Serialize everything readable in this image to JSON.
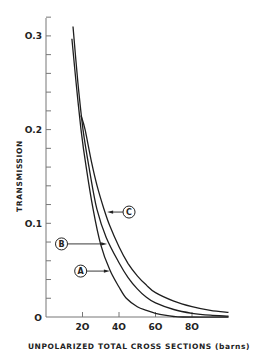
{
  "chart_data": {
    "type": "line",
    "title": "",
    "xlabel": "UNPOLARIZED TOTAL CROSS SECTIONS (barns)",
    "ylabel": "TRANSMISSION",
    "xlim": [
      0,
      100
    ],
    "ylim": [
      0,
      0.32
    ],
    "x_ticks": [
      20,
      40,
      60,
      80
    ],
    "x_tick_labels": [
      "2O",
      "4O",
      "6O",
      "8O"
    ],
    "y_ticks": [
      0,
      0.1,
      0.2,
      0.3
    ],
    "y_tick_labels": [
      "O",
      "O.1",
      "O.2",
      "O.3"
    ],
    "y_minor_step": 0.02,
    "grid": false,
    "legend": "inline circled labels with arrows",
    "series": [
      {
        "name": "A",
        "points": [
          [
            14.2,
            0.297
          ],
          [
            16.5,
            0.25
          ],
          [
            19.2,
            0.2
          ],
          [
            22,
            0.16
          ],
          [
            25.8,
            0.115
          ],
          [
            30,
            0.077
          ],
          [
            35,
            0.05
          ],
          [
            40,
            0.032
          ],
          [
            44,
            0.02
          ],
          [
            50,
            0.011
          ],
          [
            55,
            0.007
          ],
          [
            60,
            0.004
          ],
          [
            65,
            0.002
          ],
          [
            70,
            0.0005
          ],
          [
            75,
            0
          ],
          [
            100,
            0
          ]
        ]
      },
      {
        "name": "B",
        "points": [
          [
            14.8,
            0.31
          ],
          [
            17.5,
            0.25
          ],
          [
            20.3,
            0.2
          ],
          [
            24,
            0.155
          ],
          [
            27.9,
            0.115
          ],
          [
            33,
            0.085
          ],
          [
            40,
            0.058
          ],
          [
            45,
            0.042
          ],
          [
            50,
            0.03
          ],
          [
            55,
            0.021
          ],
          [
            60,
            0.015
          ],
          [
            70,
            0.008
          ],
          [
            80,
            0.004
          ],
          [
            90,
            0.002
          ],
          [
            100,
            0.001
          ]
        ]
      },
      {
        "name": "C",
        "points": [
          [
            19.2,
            0.215
          ],
          [
            21.4,
            0.2
          ],
          [
            25,
            0.165
          ],
          [
            28,
            0.14
          ],
          [
            31.8,
            0.115
          ],
          [
            35,
            0.097
          ],
          [
            40,
            0.075
          ],
          [
            45,
            0.057
          ],
          [
            50,
            0.044
          ],
          [
            55,
            0.034
          ],
          [
            60,
            0.026
          ],
          [
            70,
            0.017
          ],
          [
            80,
            0.011
          ],
          [
            90,
            0.007
          ],
          [
            100,
            0.005
          ]
        ]
      }
    ],
    "annotations": [
      {
        "label": "A",
        "label_pos": [
          19,
          0.049
        ],
        "arrow_to": [
          35,
          0.049
        ]
      },
      {
        "label": "B",
        "label_pos": [
          8.5,
          0.078
        ],
        "arrow_to": [
          33.5,
          0.078
        ]
      },
      {
        "label": "C",
        "label_pos": [
          45.5,
          0.112
        ],
        "arrow_to": [
          33.5,
          0.112
        ]
      }
    ]
  }
}
